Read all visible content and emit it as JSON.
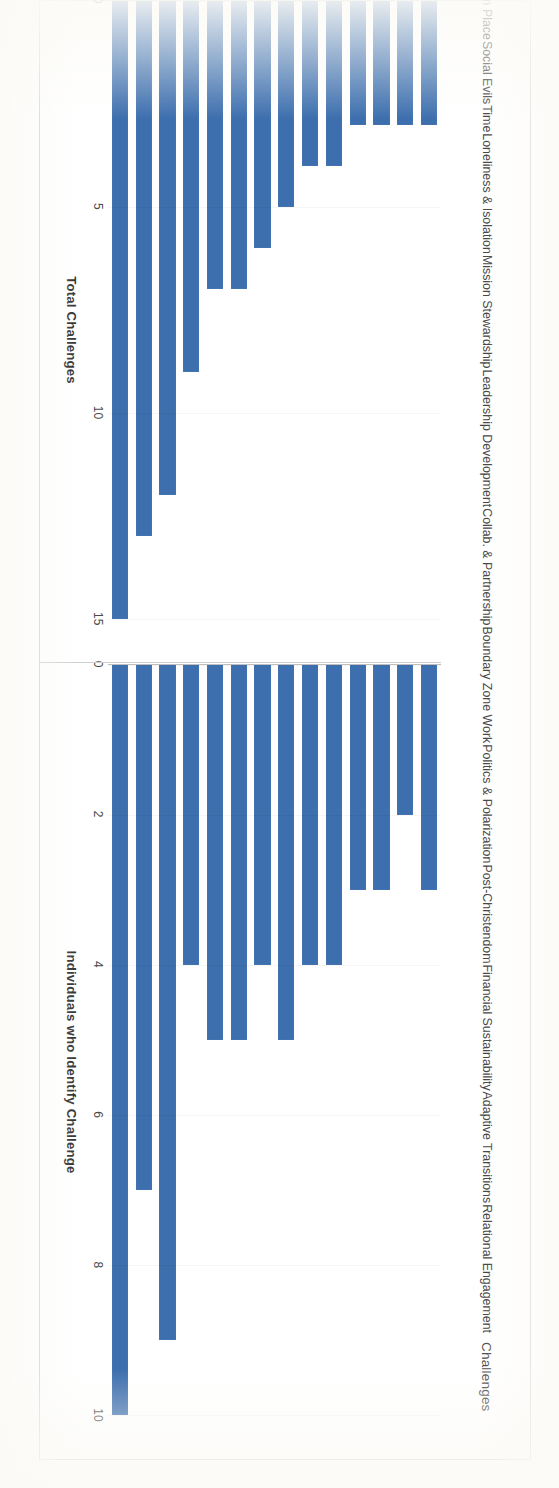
{
  "figure": {
    "category_axis_title": "Challenges",
    "categories": [
      "Relational Engagement",
      "Adaptive Transitions",
      "Financial Sustainability",
      "Post-Christendom",
      "Politics & Polarization",
      "Boundary Zone Work",
      "Collab. & Partnership",
      "Leadership Development",
      "Mission Stewardship",
      "Loneliness & Isolation",
      "Time",
      "Social Evils",
      "Removal from Place",
      "Distrust of Institutions"
    ],
    "bar_color": "#3d6fae"
  },
  "chart_data": [
    {
      "type": "bar",
      "orientation": "horizontal",
      "title": "",
      "xlabel": "Total Challenges",
      "ylabel": "Challenges",
      "categories": [
        "Relational Engagement",
        "Adaptive Transitions",
        "Financial Sustainability",
        "Post-Christendom",
        "Politics & Polarization",
        "Boundary Zone Work",
        "Collab. & Partnership",
        "Leadership Development",
        "Mission Stewardship",
        "Loneliness & Isolation",
        "Time",
        "Social Evils",
        "Removal from Place",
        "Distrust of Institutions"
      ],
      "values": [
        15,
        13,
        12,
        9,
        7,
        7,
        6,
        5,
        4,
        4,
        3,
        3,
        3,
        3
      ],
      "xlim": [
        0,
        16
      ],
      "ticks": [
        0,
        5,
        10,
        15
      ],
      "tick_labels": [
        "0",
        "5",
        "10",
        "15"
      ],
      "grid": false,
      "legend": "none"
    },
    {
      "type": "bar",
      "orientation": "horizontal",
      "title": "",
      "xlabel": "Individuals who Identify Challenge",
      "ylabel": "Challenges",
      "categories": [
        "Relational Engagement",
        "Adaptive Transitions",
        "Financial Sustainability",
        "Post-Christendom",
        "Politics & Polarization",
        "Boundary Zone Work",
        "Collab. & Partnership",
        "Leadership Development",
        "Mission Stewardship",
        "Loneliness & Isolation",
        "Time",
        "Social Evils",
        "Removal from Place",
        "Distrust of Institutions"
      ],
      "values": [
        10,
        7,
        9,
        4,
        5,
        5,
        4,
        5,
        4,
        4,
        3,
        3,
        2,
        3
      ],
      "xlim": [
        0,
        10.6
      ],
      "ticks": [
        0,
        2,
        4,
        6,
        8,
        10
      ],
      "tick_labels": [
        "0",
        "2",
        "4",
        "6",
        "8",
        "10"
      ],
      "grid": false,
      "legend": "none"
    }
  ]
}
